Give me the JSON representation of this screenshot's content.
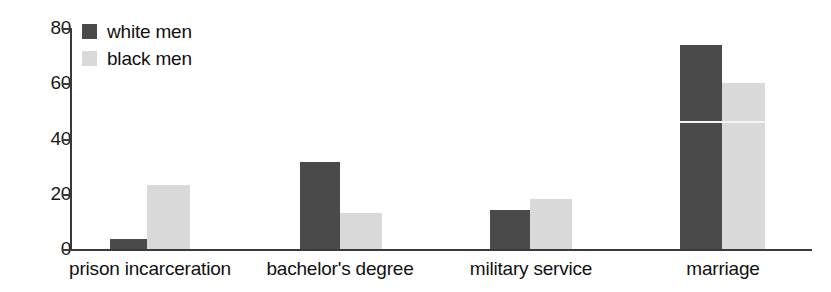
{
  "chart_data": {
    "type": "bar",
    "title": "",
    "xlabel": "",
    "ylabel": "",
    "ylim": [
      0,
      80
    ],
    "yticks": [
      0,
      20,
      40,
      60,
      80
    ],
    "ytick_labels": [
      "0",
      "20",
      "40",
      "60",
      "80"
    ],
    "grid": false,
    "legend_position": "top-left",
    "categories": [
      "prison incarceration",
      "bachelor's degree",
      "military service",
      "marriage"
    ],
    "series": [
      {
        "name": "white men",
        "color": "#4a4a4a",
        "values": [
          3.5,
          31.5,
          14,
          74
        ]
      },
      {
        "name": "black men",
        "color": "#d9d9d9",
        "values": [
          23,
          13,
          18,
          60
        ]
      }
    ]
  },
  "legend": {
    "items": [
      {
        "label": "white men",
        "swatch_class": "white-men"
      },
      {
        "label": "black men",
        "swatch_class": "black-men"
      }
    ]
  }
}
